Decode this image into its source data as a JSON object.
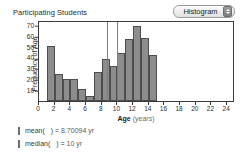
{
  "chart_title": "Participating Students",
  "plot_type_menu": {
    "selected": "Histogram",
    "stepper_icon": "up-down-stepper-icon"
  },
  "axes": {
    "y_title": "Frequency of Age",
    "y_ticks": [
      10,
      20,
      30,
      40,
      50,
      60,
      70
    ],
    "x_title_main": "Age",
    "x_title_unit": "(years)",
    "x_ticks": [
      0,
      2,
      4,
      6,
      8,
      10,
      12,
      14,
      16,
      18,
      20,
      22,
      24
    ]
  },
  "stats": [
    {
      "name": "mean",
      "label_prefix": "mean(",
      "label_suffix": ") =",
      "value": "8.70094",
      "unit": "yr",
      "full": "mean( ) = 8.70094 yr"
    },
    {
      "name": "median",
      "label_prefix": "median(",
      "label_suffix": ") =",
      "value": "10",
      "unit": "yr",
      "full": "median( ) = 10 yr"
    }
  ],
  "chart_data": {
    "type": "bar",
    "title": "Participating Students",
    "xlabel": "Age (years)",
    "ylabel": "Frequency of Age",
    "xlim": [
      0,
      25
    ],
    "ylim": [
      0,
      75
    ],
    "bin_width": 1,
    "grid": false,
    "legend": null,
    "bin_starts": [
      1,
      2,
      3,
      4,
      5,
      6,
      7,
      8,
      9,
      10,
      11,
      12,
      13,
      14
    ],
    "categories": [
      "1-2",
      "2-3",
      "3-4",
      "4-5",
      "5-6",
      "6-7",
      "7-8",
      "8-9",
      "9-10",
      "10-11",
      "11-12",
      "12-13",
      "13-14",
      "14-15"
    ],
    "values": [
      51,
      25,
      20,
      20,
      11,
      5,
      27,
      39,
      32,
      44,
      57,
      69,
      58,
      43
    ],
    "reference_lines": [
      {
        "name": "mean",
        "x": 8.70094,
        "color": "#7d7d7d"
      },
      {
        "name": "median",
        "x": 10,
        "color": "#7d7d7d"
      }
    ]
  }
}
